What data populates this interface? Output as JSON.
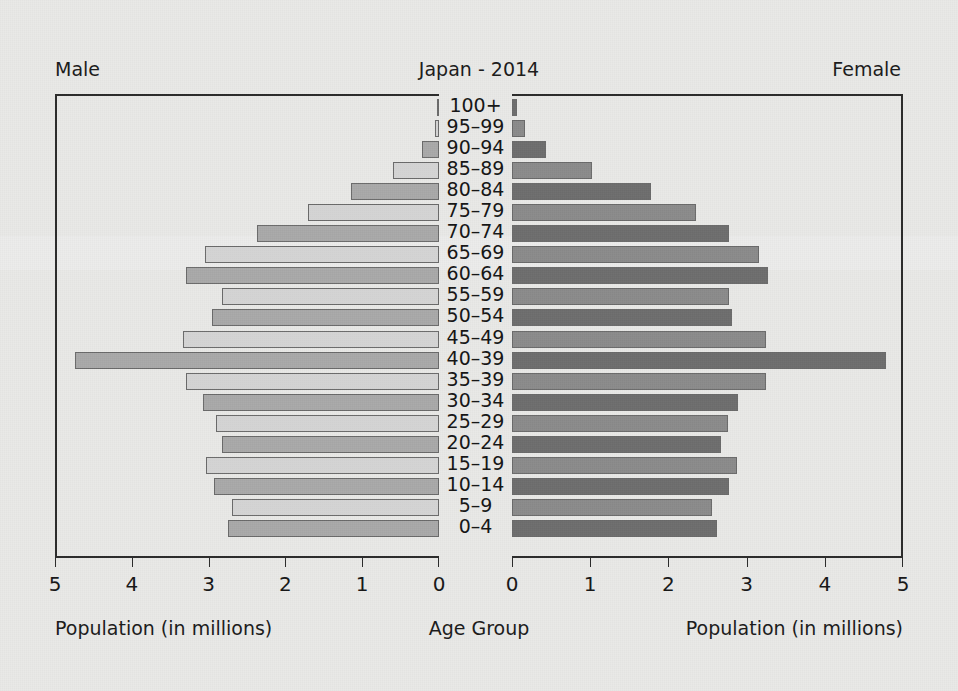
{
  "header": {
    "male_label": "Male",
    "title": "Japan - 2014",
    "female_label": "Female"
  },
  "captions": {
    "male": "Population (in millions)",
    "center": "Age Group",
    "female": "Population (in millions)"
  },
  "colors": {
    "background": "#e9e9e7",
    "frame": "#2a2a2a",
    "text": "#1a1a1a",
    "male_light": "#d4d4d4",
    "male_dark": "#a9a9a9",
    "female_light": "#8b8b8b",
    "female_dark": "#6d6d6d",
    "bar_border": "#6a6a6a"
  },
  "chart_data": {
    "type": "bar",
    "subtype": "population-pyramid",
    "title": "Japan - 2014",
    "xlabel": "Population (in millions)",
    "ylabel": "Age Group",
    "xlim_left": [
      5,
      0
    ],
    "xlim_right": [
      0,
      5
    ],
    "xticks_left": [
      "5",
      "4",
      "3",
      "2",
      "1",
      "0"
    ],
    "xticks_right": [
      "0",
      "1",
      "2",
      "3",
      "4",
      "5"
    ],
    "grid": false,
    "legend": "none",
    "units": "millions",
    "categories": [
      "100+",
      "95–99",
      "90–94",
      "85–89",
      "80–84",
      "75–79",
      "70–74",
      "65–69",
      "60–64",
      "55–59",
      "50–54",
      "45–49",
      "40–39",
      "35–39",
      "30–34",
      "25–29",
      "20–24",
      "15–19",
      "10–14",
      "5–9",
      "0–4"
    ],
    "series": [
      {
        "name": "Male",
        "side": "left",
        "values": [
          0.01,
          0.05,
          0.22,
          0.6,
          1.14,
          1.71,
          2.37,
          3.05,
          3.29,
          2.82,
          2.95,
          3.33,
          4.74,
          3.29,
          3.07,
          2.9,
          2.82,
          3.03,
          2.93,
          2.7,
          2.75
        ]
      },
      {
        "name": "Female",
        "side": "right",
        "values": [
          0.06,
          0.17,
          0.44,
          1.02,
          1.78,
          2.35,
          2.78,
          3.16,
          3.27,
          2.77,
          2.81,
          3.25,
          4.78,
          3.25,
          2.89,
          2.76,
          2.67,
          2.88,
          2.78,
          2.56,
          2.62
        ]
      }
    ]
  }
}
